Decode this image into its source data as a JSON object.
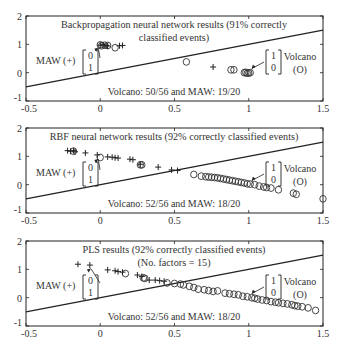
{
  "chart_data": [
    {
      "type": "scatter",
      "title": "Backpropagation neural network results (91% correctly classified events)",
      "title_lines": [
        "Backpropagation neural network results (91% correctly",
        "classified events)"
      ],
      "subtitle": "",
      "summary": "Volcano: 50/56 and MAW: 19/20",
      "xlim": [
        -0.5,
        1.5
      ],
      "ylim": [
        -1,
        2
      ],
      "xticks": [
        "-0.5",
        "0",
        "0.5",
        "1",
        "1.5"
      ],
      "yticks": [
        "-1",
        "0",
        "1",
        "2"
      ],
      "decision_line": {
        "x": [
          -0.5,
          1.5
        ],
        "y": [
          -0.5,
          1.5
        ]
      },
      "legend": {
        "maw_label": "MAW (+)",
        "maw_vector": [
          "0",
          "1"
        ],
        "volcano_label": "Volcano",
        "volcano_symbol": "(O)",
        "volcano_vector": [
          "1",
          "0"
        ]
      },
      "series": [
        {
          "name": "MAW (+)",
          "marker": "+",
          "points": [
            [
              0.0,
              0.97
            ],
            [
              0.02,
              0.98
            ],
            [
              0.04,
              0.96
            ],
            [
              0.13,
              0.95
            ],
            [
              0.15,
              0.96
            ],
            [
              0.76,
              0.2
            ],
            [
              0.05,
              0.94
            ]
          ]
        },
        {
          "name": "Volcano (O)",
          "marker": "o",
          "points": [
            [
              0.0,
              0.98
            ],
            [
              0.01,
              0.95
            ],
            [
              0.03,
              0.97
            ],
            [
              0.05,
              0.96
            ],
            [
              0.1,
              0.88
            ],
            [
              0.58,
              0.38
            ],
            [
              0.88,
              0.1
            ],
            [
              0.9,
              0.1
            ],
            [
              0.97,
              0.0
            ],
            [
              0.98,
              0.01
            ],
            [
              1.0,
              -0.01
            ],
            [
              1.01,
              0.0
            ],
            [
              0.99,
              -0.02
            ]
          ]
        }
      ]
    },
    {
      "type": "scatter",
      "title": "RBF neural network results (92% correctly classified events)",
      "title_lines": [
        "RBF neural network results (92% correctly classified events)"
      ],
      "subtitle": "",
      "summary": "Volcano: 52/56 and MAW: 18/20",
      "xlim": [
        -0.5,
        1.5
      ],
      "ylim": [
        -1,
        2
      ],
      "xticks": [
        "-0.5",
        "0",
        "0.5",
        "1",
        "1.5"
      ],
      "yticks": [
        "-1",
        "0",
        "1",
        "2"
      ],
      "decision_line": {
        "x": [
          -0.5,
          1.5
        ],
        "y": [
          -0.5,
          1.5
        ]
      },
      "legend": {
        "maw_label": "MAW (+)",
        "maw_vector": [
          "0",
          "1"
        ],
        "volcano_label": "Volcano",
        "volcano_symbol": "(O)",
        "volcano_vector": [
          "1",
          "0"
        ]
      },
      "series": [
        {
          "name": "MAW (+)",
          "marker": "+",
          "points": [
            [
              -0.22,
              1.2
            ],
            [
              -0.2,
              1.18
            ],
            [
              -0.18,
              1.2
            ],
            [
              -0.17,
              1.16
            ],
            [
              -0.1,
              1.12
            ],
            [
              -0.02,
              1.05
            ],
            [
              0.05,
              0.98
            ],
            [
              0.08,
              0.97
            ],
            [
              0.1,
              0.95
            ],
            [
              0.12,
              0.94
            ],
            [
              0.2,
              0.9
            ],
            [
              0.22,
              0.88
            ],
            [
              0.27,
              0.72
            ],
            [
              0.39,
              0.62
            ],
            [
              0.48,
              0.52
            ],
            [
              0.52,
              0.5
            ]
          ]
        },
        {
          "name": "Volcano (O)",
          "marker": "o",
          "points": [
            [
              -0.18,
              1.18
            ],
            [
              0.0,
              0.96
            ],
            [
              0.27,
              0.7
            ],
            [
              0.28,
              0.7
            ],
            [
              0.63,
              0.36
            ],
            [
              0.68,
              0.3
            ],
            [
              0.71,
              0.28
            ],
            [
              0.73,
              0.27
            ],
            [
              0.75,
              0.26
            ],
            [
              0.77,
              0.25
            ],
            [
              0.79,
              0.24
            ],
            [
              0.81,
              0.22
            ],
            [
              0.83,
              0.2
            ],
            [
              0.85,
              0.18
            ],
            [
              0.87,
              0.16
            ],
            [
              0.89,
              0.14
            ],
            [
              0.91,
              0.12
            ],
            [
              0.93,
              0.1
            ],
            [
              0.95,
              0.08
            ],
            [
              0.97,
              0.06
            ],
            [
              0.99,
              0.03
            ],
            [
              1.01,
              0.02
            ],
            [
              1.04,
              0.0
            ],
            [
              1.07,
              -0.05
            ],
            [
              1.1,
              -0.08
            ],
            [
              1.12,
              -0.1
            ],
            [
              1.15,
              -0.12
            ],
            [
              1.2,
              -0.18
            ],
            [
              1.3,
              -0.3
            ],
            [
              1.32,
              -0.34
            ],
            [
              1.5,
              -0.5
            ]
          ]
        }
      ]
    },
    {
      "type": "scatter",
      "title": "PLS results (92% correctly classified events)",
      "title_lines": [
        "PLS results (92% correctly classified events)",
        "(No. factors = 15)"
      ],
      "subtitle": "(No. factors = 15)",
      "summary": "Volcano: 52/56 and MAW: 18/20",
      "xlim": [
        -0.5,
        1.5
      ],
      "ylim": [
        -1,
        2
      ],
      "xticks": [
        "-0.5",
        "0",
        "0.5",
        "1",
        "1.5"
      ],
      "yticks": [
        "-1",
        "0",
        "1",
        "2"
      ],
      "decision_line": {
        "x": [
          -0.5,
          1.5
        ],
        "y": [
          -0.5,
          1.5
        ]
      },
      "legend": {
        "maw_label": "MAW (+)",
        "maw_vector": [
          "0",
          "1"
        ],
        "volcano_label": "Volcano",
        "volcano_symbol": "(O)",
        "volcano_vector": [
          "1",
          "0"
        ]
      },
      "series": [
        {
          "name": "MAW (+)",
          "marker": "+",
          "points": [
            [
              -0.15,
              1.18
            ],
            [
              -0.07,
              1.15
            ],
            [
              0.05,
              0.98
            ],
            [
              0.1,
              0.95
            ],
            [
              0.12,
              0.92
            ],
            [
              0.15,
              0.9
            ],
            [
              0.25,
              0.8
            ],
            [
              0.28,
              0.75
            ],
            [
              0.33,
              0.62
            ],
            [
              0.37,
              0.62
            ],
            [
              0.4,
              0.6
            ],
            [
              0.43,
              0.58
            ]
          ]
        },
        {
          "name": "Volcano (O)",
          "marker": "o",
          "points": [
            [
              0.17,
              0.85
            ],
            [
              0.29,
              0.7
            ],
            [
              0.3,
              0.68
            ],
            [
              0.45,
              0.52
            ],
            [
              0.5,
              0.5
            ],
            [
              0.54,
              0.48
            ],
            [
              0.56,
              0.45
            ],
            [
              0.6,
              0.4
            ],
            [
              0.63,
              0.36
            ],
            [
              0.66,
              0.3
            ],
            [
              0.7,
              0.28
            ],
            [
              0.73,
              0.25
            ],
            [
              0.76,
              0.22
            ],
            [
              0.79,
              0.24
            ],
            [
              0.84,
              0.16
            ],
            [
              0.87,
              0.14
            ],
            [
              0.9,
              0.12
            ],
            [
              0.93,
              0.1
            ],
            [
              0.96,
              0.05
            ],
            [
              0.99,
              0.03
            ],
            [
              1.02,
              0.0
            ],
            [
              1.04,
              -0.02
            ],
            [
              1.06,
              -0.05
            ],
            [
              1.09,
              -0.08
            ],
            [
              1.12,
              -0.1
            ],
            [
              1.15,
              -0.14
            ],
            [
              1.18,
              -0.16
            ],
            [
              1.2,
              -0.18
            ],
            [
              1.23,
              -0.2
            ],
            [
              1.26,
              -0.22
            ],
            [
              1.29,
              -0.25
            ],
            [
              1.31,
              -0.28
            ],
            [
              1.33,
              -0.3
            ],
            [
              1.36,
              -0.32
            ],
            [
              1.4,
              -0.36
            ],
            [
              1.45,
              -0.45
            ]
          ]
        }
      ]
    }
  ],
  "panels": [
    {
      "title_line1": "Backpropagation neural network results (91% correctly",
      "title_line2": "classified events)",
      "summary": "Volcano: 50/56 and MAW: 19/20"
    },
    {
      "title_line1": "RBF neural network results (92% correctly classified events)",
      "title_line2": "",
      "summary": "Volcano: 52/56 and MAW: 18/20"
    },
    {
      "title_line1": "PLS results (92% correctly classified events)",
      "title_line2": "(No. factors = 15)",
      "summary": "Volcano: 52/56 and MAW: 18/20"
    }
  ],
  "legend": {
    "maw_label": "MAW (+)",
    "maw_v0": "0",
    "maw_v1": "1",
    "volcano_label": "Volcano",
    "volcano_symbol": "(O)",
    "volcano_v0": "1",
    "volcano_v1": "0"
  },
  "axes": {
    "xticks": [
      "-0.5",
      "0",
      "0.5",
      "1",
      "1.5"
    ],
    "yticks": [
      "-1",
      "0",
      "1",
      "2"
    ]
  },
  "colors": {
    "ink": "#222222",
    "background": "#ffffff"
  }
}
